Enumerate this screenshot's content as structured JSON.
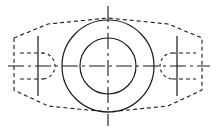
{
  "canvas": {
    "width": 216,
    "height": 131,
    "background": "#ffffff",
    "title": "Engineering drawing - front view of flanged bushing"
  },
  "style": {
    "line_color": "#1a1a1a",
    "solid_width": 1.2,
    "hidden_width": 1.1,
    "center_width": 1.1,
    "hidden_dash": "4,3",
    "center_dash": "9,3,2,3"
  },
  "geometry": {
    "center": {
      "x": 108,
      "y": 66
    },
    "outer_circle": {
      "cx": 108,
      "cy": 66,
      "r": 46,
      "linetype": "solid"
    },
    "inner_circle": {
      "cx": 108,
      "cy": 66,
      "r": 28,
      "linetype": "solid"
    },
    "horizontal_centerline": {
      "x1": 8,
      "y1": 66,
      "x2": 210,
      "y2": 66,
      "linetype": "center"
    },
    "vertical_centerline": {
      "x1": 108,
      "y1": 6,
      "x2": 108,
      "y2": 126,
      "linetype": "center"
    },
    "hidden_hexagon": {
      "linetype": "hidden",
      "points": "14,38 14,90 48,106 108,112 168,106 202,90 202,38 168,24 108,18 48,24"
    },
    "left_flange_bar": {
      "x": 38,
      "y1": 36,
      "y2": 96,
      "linetype": "solid"
    },
    "right_flange_bar": {
      "x": 177,
      "y1": 36,
      "y2": 96,
      "linetype": "solid"
    },
    "left_hidden_arc": {
      "cx": 40,
      "cy": 66,
      "r": 13,
      "linetype": "hidden"
    },
    "right_hidden_arc": {
      "cx": 175,
      "cy": 66,
      "r": 13,
      "linetype": "hidden"
    },
    "left_hidden_ticks": [
      {
        "x1": 20,
        "y1": 53,
        "x2": 44,
        "y2": 53
      },
      {
        "x1": 20,
        "y1": 79,
        "x2": 44,
        "y2": 79
      }
    ],
    "right_hidden_ticks": [
      {
        "x1": 172,
        "y1": 53,
        "x2": 196,
        "y2": 53
      },
      {
        "x1": 172,
        "y1": 79,
        "x2": 196,
        "y2": 79
      }
    ]
  },
  "labels": {
    "view_name": "",
    "dimensions": []
  }
}
